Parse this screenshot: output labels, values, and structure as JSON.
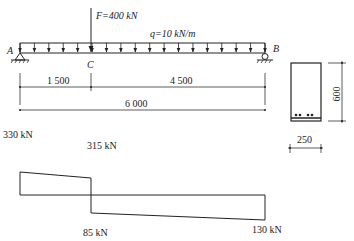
{
  "beam": {
    "support_left_label": "A",
    "support_right_label": "B",
    "point_C_label": "C",
    "point_load_label": "F=400 kN",
    "udl_label": "q=10 kN/m"
  },
  "dimensions": {
    "seg_AC": "1 500",
    "seg_CB": "4 500",
    "total": "6 000"
  },
  "section": {
    "height": "600",
    "width": "250"
  },
  "shear_diagram": {
    "labels": {
      "left": "330 kN",
      "c_top": "315 kN",
      "c_bottom": "85 kN",
      "right": "130 kN"
    }
  },
  "chart_data": {
    "type": "line",
    "x": [
      0,
      1500,
      1500,
      6000
    ],
    "values": [
      330,
      315,
      -85,
      -130
    ],
    "unit": "kN"
  }
}
